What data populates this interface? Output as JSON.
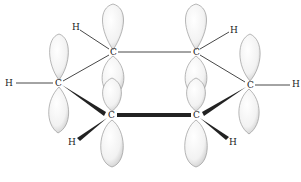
{
  "diagram": {
    "type": "molecular-orbital-diagram",
    "atoms": {
      "c1": {
        "label": "C",
        "x": 113,
        "y": 52
      },
      "c2": {
        "label": "C",
        "x": 196,
        "y": 52
      },
      "c3": {
        "label": "C",
        "x": 58,
        "y": 83
      },
      "c4": {
        "label": "C",
        "x": 250,
        "y": 85
      },
      "c5": {
        "label": "C",
        "x": 111,
        "y": 115
      },
      "c6": {
        "label": "C",
        "x": 196,
        "y": 115
      },
      "h1": {
        "label": "H",
        "x": 75,
        "y": 27
      },
      "h2": {
        "label": "H",
        "x": 9,
        "y": 83
      },
      "h3": {
        "label": "H",
        "x": 72,
        "y": 142
      },
      "h4": {
        "label": "H",
        "x": 233,
        "y": 30
      },
      "h5": {
        "label": "H",
        "x": 295,
        "y": 84
      },
      "h6": {
        "label": "H",
        "x": 232,
        "y": 142
      }
    },
    "colors": {
      "bond": "#333333",
      "lobe_fill": "#f7f7f7",
      "lobe_stroke": "#888888",
      "background": "#ffffff"
    }
  }
}
